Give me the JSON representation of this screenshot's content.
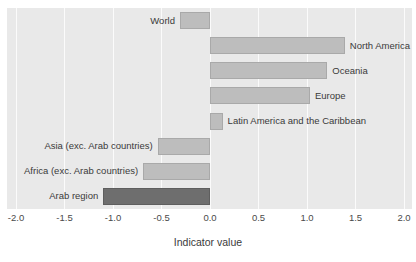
{
  "title_fragment": "",
  "chart_data": {
    "type": "bar",
    "orientation": "horizontal",
    "title": "",
    "xlabel": "Indicator value",
    "ylabel": "",
    "xlim": [
      -2.0,
      2.0
    ],
    "grid": true,
    "legend": "none",
    "tick_labels": [
      "-2.0",
      "-1.5",
      "-1.0",
      "-0.5",
      "0.0",
      "0.5",
      "1.0",
      "1.5",
      "2.0"
    ],
    "tick_values": [
      -2.0,
      -1.5,
      -1.0,
      -0.5,
      0.0,
      0.5,
      1.0,
      1.5,
      2.0
    ],
    "categories": [
      "World",
      "North America",
      "Oceania",
      "Europe",
      "Latin America and the Caribbean",
      "Asia (exc. Arab countries)",
      "Africa (exc. Arab countries)",
      "Arab region"
    ],
    "values": [
      -0.31,
      1.39,
      1.21,
      1.03,
      0.13,
      -0.54,
      -0.69,
      -1.1
    ],
    "bar_colors": [
      "#bdbdbd",
      "#bdbdbd",
      "#bdbdbd",
      "#bdbdbd",
      "#bdbdbd",
      "#bdbdbd",
      "#bdbdbd",
      "#6e6e6e"
    ],
    "highlight_category": "Arab region",
    "plot_background": "#e9e9e9",
    "gridline_color": "#fbfbfb",
    "bar_border_color": "#a9a9a9"
  }
}
